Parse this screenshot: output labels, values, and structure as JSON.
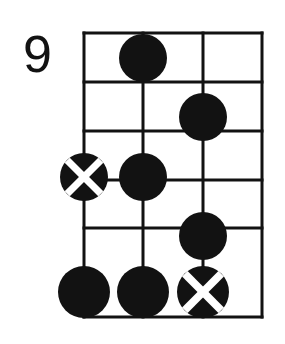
{
  "diagram": {
    "kind": "guitar-chord-diagram",
    "fret_label": "9",
    "instrument_strings_shown": 4,
    "frets_shown": 5,
    "colors": {
      "ink": "#121212",
      "paper": "#ffffff",
      "marker_fill": "#121212",
      "marker_cross": "#ffffff"
    },
    "grid": {
      "left": 84,
      "right": 262,
      "top": 33,
      "bottom": 317,
      "string_x": [
        84,
        143,
        203,
        262
      ],
      "fret_y": [
        33,
        82,
        131,
        180,
        228,
        317
      ],
      "line_width": 3
    },
    "markers": [
      {
        "id": "marker-1",
        "type": "filled-dot",
        "string": 2,
        "fret": 1,
        "cx": 143,
        "cy": 58,
        "r": 24
      },
      {
        "id": "marker-2",
        "type": "filled-dot",
        "string": 3,
        "fret": 2,
        "cx": 203,
        "cy": 117,
        "r": 24
      },
      {
        "id": "marker-3",
        "type": "cross-dot",
        "string": 1,
        "fret": 3,
        "cx": 84,
        "cy": 177,
        "r": 24
      },
      {
        "id": "marker-4",
        "type": "filled-dot",
        "string": 2,
        "fret": 3,
        "cx": 143,
        "cy": 177,
        "r": 24
      },
      {
        "id": "marker-5",
        "type": "filled-dot",
        "string": 3,
        "fret": 4,
        "cx": 203,
        "cy": 236,
        "r": 24
      },
      {
        "id": "marker-6",
        "type": "filled-dot",
        "string": 1,
        "fret": 5,
        "cx": 84,
        "cy": 292,
        "r": 26
      },
      {
        "id": "marker-7",
        "type": "filled-dot",
        "string": 2,
        "fret": 5,
        "cx": 143,
        "cy": 292,
        "r": 26
      },
      {
        "id": "marker-8",
        "type": "cross-dot",
        "string": 3,
        "fret": 5,
        "cx": 203,
        "cy": 292,
        "r": 26
      }
    ]
  }
}
